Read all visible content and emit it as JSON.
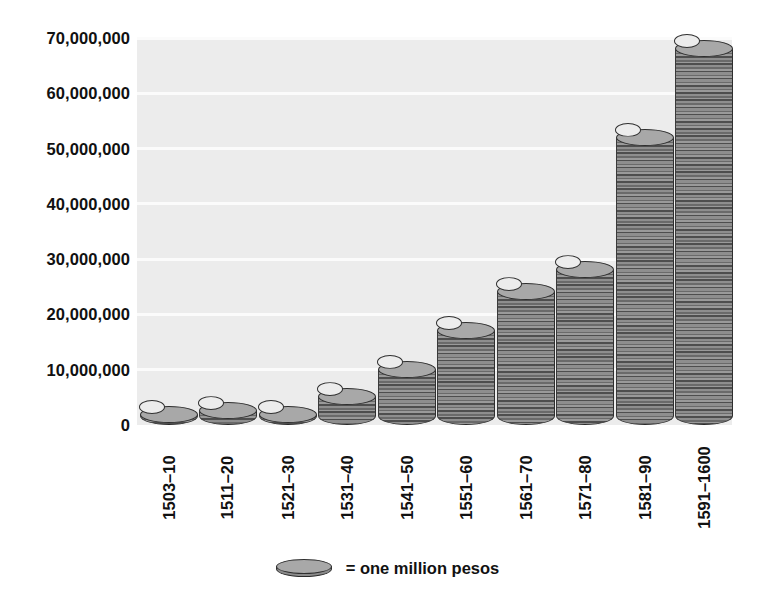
{
  "chart_data": {
    "type": "bar",
    "title": "",
    "xlabel": "",
    "ylabel": "",
    "unit_note": "Each coin glyph = one million pesos",
    "grid": true,
    "legend_position": "bottom-center",
    "ylim": [
      0,
      70000000
    ],
    "yticks": [
      0,
      10000000,
      20000000,
      30000000,
      40000000,
      50000000,
      60000000,
      70000000
    ],
    "ytick_labels": [
      "0",
      "10,000,000",
      "20,000,000",
      "30,000,000",
      "40,000,000",
      "50,000,000",
      "60,000,000",
      "70,000,000"
    ],
    "categories": [
      "1503–10",
      "1511–20",
      "1521–30",
      "1531–40",
      "1541–50",
      "1551–60",
      "1561–70",
      "1571–80",
      "1581–90",
      "1591–1600"
    ],
    "values": [
      1500000,
      2500000,
      1500000,
      5000000,
      10000000,
      17000000,
      24000000,
      28000000,
      52000000,
      68000000
    ],
    "series": [
      {
        "name": "Treasure imports (pesos)",
        "values": [
          1500000,
          2500000,
          1500000,
          5000000,
          10000000,
          17000000,
          24000000,
          28000000,
          52000000,
          68000000
        ]
      }
    ]
  },
  "legend": {
    "text": "= one million pesos",
    "icon": "coin-icon"
  },
  "colors": {
    "plot_background": "#ececec",
    "gridline": "#fbfbfb",
    "coin_top": "#a8a8a8",
    "coin_body_dark": "#4e4e4e",
    "coin_body_light": "#9a9a9a",
    "coin_outline": "#2f2f2f",
    "text": "#111111",
    "page_background": "#ffffff"
  }
}
